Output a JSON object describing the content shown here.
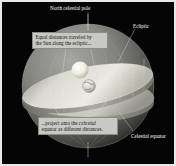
{
  "figure": {
    "title": "Celestial sphere showing equal Sun distances along the ecliptic projecting onto the celestial equator",
    "background_color": "#050505",
    "frame_color": "#e8e8e6",
    "callout_bg": "#c9c9c4",
    "callout_text_color": "#14110c",
    "label_text_color": "#ffffff",
    "sphere_color": "#8c8c88",
    "ecliptic_disk_color": "#d6d6cf",
    "equator_disk_color": "#b4b4ac",
    "sun_color": "#f2f2ea",
    "earth_color": "#d8d8d0"
  },
  "labels": {
    "north_celestial_pole": "North celestial pole",
    "ecliptic": "Ecliptic",
    "celestial_equator": "Celestial equator"
  },
  "callouts": {
    "top": {
      "line1": "Equal distances traveled by",
      "line2": "the Sun along the ecliptic..."
    },
    "bottom": {
      "line1_pre": "...project onto the ",
      "line1_em": "celestial",
      "line2": "equator as different distances."
    }
  },
  "objects": {
    "sun": "Sun",
    "earth": "Earth",
    "celestial_sphere": "celestial sphere",
    "ecliptic_plane": "ecliptic plane",
    "equatorial_plane": "equatorial plane",
    "polar_axis": "polar axis"
  }
}
